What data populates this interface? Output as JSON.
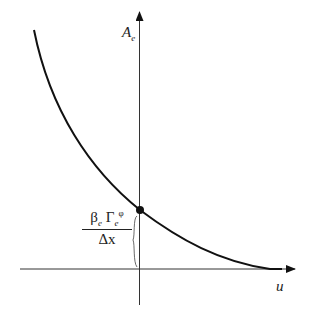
{
  "diagram": {
    "y_axis_label": "A",
    "y_axis_label_sub": "e",
    "x_axis_label": "u",
    "intercept_label": {
      "numerator_beta": "β",
      "numerator_beta_sub": "e",
      "numerator_gamma": "Γ",
      "numerator_gamma_sub": "e",
      "numerator_gamma_sup": "φ",
      "denominator": "Δx"
    },
    "curve": "decreasing convex curve approaching u-axis asymptotically",
    "colors": {
      "line": "#111111",
      "background": "#ffffff"
    }
  }
}
